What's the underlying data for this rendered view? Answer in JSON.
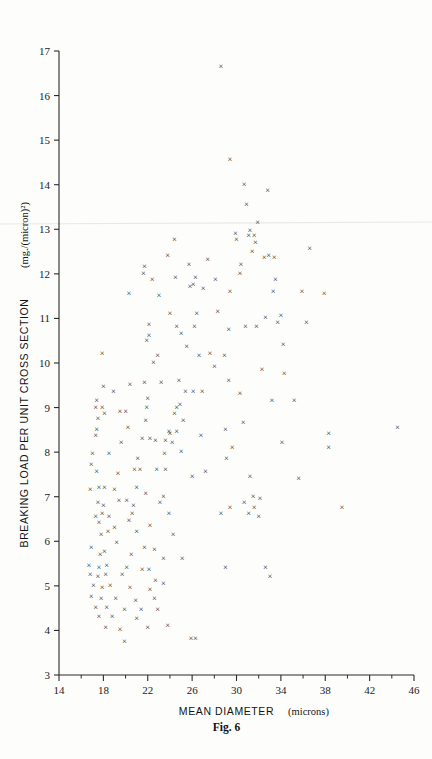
{
  "figure": {
    "caption": "Fig. 6",
    "marker_glyph": "×",
    "marker_color": "#252525",
    "background_color": "#fdfdfb",
    "axis_color": "#2a2a2a"
  },
  "chart_data": {
    "type": "scatter",
    "title": "",
    "xlabel_main": "MEAN DIAMETER",
    "xlabel_units": "(microns)",
    "xlabel": "MEAN DIAMETER (microns)",
    "ylabel_main": "BREAKING LOAD PER UNIT CROSS SECTION",
    "ylabel_units": "(mg./(micron)²)",
    "ylabel": "BREAKING LOAD PER UNIT CROSS SECTION (mg./(micron)²)",
    "xlim": [
      14,
      46
    ],
    "ylim": [
      3,
      17
    ],
    "xticks": [
      14,
      18,
      22,
      26,
      30,
      34,
      38,
      42,
      46
    ],
    "xticklabels": [
      "14",
      "18",
      "22",
      "26",
      "30",
      "34",
      "38",
      "42",
      "46"
    ],
    "xminorticks": [
      16,
      20,
      24,
      28,
      32,
      36,
      40,
      44
    ],
    "yticks": [
      3,
      4,
      5,
      6,
      7,
      8,
      9,
      10,
      11,
      12,
      13,
      14,
      15,
      16,
      17
    ],
    "yticklabels": [
      "3",
      "4",
      "5",
      "6",
      "7",
      "8",
      "9",
      "10",
      "11",
      "12",
      "13",
      "14",
      "15",
      "16",
      "17"
    ],
    "grid": false,
    "legend": false,
    "n_points": 205,
    "points": [
      [
        28.6,
        16.65
      ],
      [
        29.4,
        14.55
      ],
      [
        32.8,
        13.85
      ],
      [
        30.9,
        13.55
      ],
      [
        31.9,
        13.15
      ],
      [
        31.6,
        12.85
      ],
      [
        31.7,
        12.7
      ],
      [
        24.4,
        12.75
      ],
      [
        31.2,
        12.95
      ],
      [
        31.1,
        12.85
      ],
      [
        31.4,
        12.5
      ],
      [
        23.8,
        12.4
      ],
      [
        32.5,
        12.35
      ],
      [
        33.4,
        12.35
      ],
      [
        21.7,
        12.15
      ],
      [
        21.6,
        12.0
      ],
      [
        25.7,
        12.2
      ],
      [
        30.4,
        12.2
      ],
      [
        30.3,
        12.0
      ],
      [
        22.4,
        11.85
      ],
      [
        24.5,
        11.9
      ],
      [
        26.3,
        11.9
      ],
      [
        26.1,
        11.75
      ],
      [
        33.5,
        11.85
      ],
      [
        20.3,
        11.55
      ],
      [
        25.8,
        11.7
      ],
      [
        27.0,
        11.65
      ],
      [
        29.4,
        11.6
      ],
      [
        33.3,
        11.6
      ],
      [
        37.9,
        11.55
      ],
      [
        24.0,
        11.1
      ],
      [
        26.4,
        11.1
      ],
      [
        28.3,
        11.15
      ],
      [
        32.6,
        11.0
      ],
      [
        22.1,
        10.85
      ],
      [
        24.6,
        10.8
      ],
      [
        26.2,
        10.8
      ],
      [
        29.3,
        10.75
      ],
      [
        30.8,
        10.8
      ],
      [
        31.8,
        10.8
      ],
      [
        25.0,
        10.65
      ],
      [
        21.9,
        10.5
      ],
      [
        22.1,
        10.6
      ],
      [
        34.2,
        10.4
      ],
      [
        17.9,
        10.2
      ],
      [
        26.6,
        10.15
      ],
      [
        28.9,
        10.15
      ],
      [
        32.3,
        9.85
      ],
      [
        22.5,
        10.0
      ],
      [
        34.3,
        9.75
      ],
      [
        21.7,
        9.55
      ],
      [
        29.3,
        9.6
      ],
      [
        18.0,
        9.45
      ],
      [
        17.4,
        9.15
      ],
      [
        22.0,
        9.2
      ],
      [
        25.4,
        9.35
      ],
      [
        26.1,
        9.35
      ],
      [
        26.9,
        9.35
      ],
      [
        30.3,
        9.3
      ],
      [
        33.2,
        9.15
      ],
      [
        17.3,
        9.0
      ],
      [
        17.9,
        9.0
      ],
      [
        21.9,
        9.0
      ],
      [
        24.6,
        9.0
      ],
      [
        24.9,
        9.05
      ],
      [
        17.5,
        8.75
      ],
      [
        18.1,
        8.85
      ],
      [
        21.8,
        8.7
      ],
      [
        24.4,
        8.85
      ],
      [
        25.2,
        8.7
      ],
      [
        30.6,
        8.65
      ],
      [
        17.4,
        8.5
      ],
      [
        20.2,
        8.55
      ],
      [
        23.9,
        8.45
      ],
      [
        24.0,
        8.4
      ],
      [
        24.6,
        8.45
      ],
      [
        29.0,
        8.5
      ],
      [
        38.3,
        8.4
      ],
      [
        44.5,
        8.55
      ],
      [
        17.3,
        8.35
      ],
      [
        21.5,
        8.3
      ],
      [
        22.2,
        8.3
      ],
      [
        22.7,
        8.25
      ],
      [
        23.6,
        8.25
      ],
      [
        24.2,
        8.2
      ],
      [
        29.6,
        8.1
      ],
      [
        34.1,
        8.2
      ],
      [
        38.3,
        8.1
      ],
      [
        17.0,
        7.95
      ],
      [
        18.5,
        7.95
      ],
      [
        21.1,
        7.85
      ],
      [
        23.5,
        7.95
      ],
      [
        25.0,
        8.0
      ],
      [
        29.1,
        7.85
      ],
      [
        16.9,
        7.7
      ],
      [
        17.4,
        7.55
      ],
      [
        20.8,
        7.6
      ],
      [
        21.3,
        7.6
      ],
      [
        22.8,
        7.6
      ],
      [
        23.6,
        7.6
      ],
      [
        26.0,
        7.45
      ],
      [
        31.2,
        7.45
      ],
      [
        35.6,
        7.4
      ],
      [
        16.8,
        7.15
      ],
      [
        17.6,
        7.2
      ],
      [
        18.1,
        7.2
      ],
      [
        19.0,
        7.15
      ],
      [
        21.0,
        7.2
      ],
      [
        21.8,
        7.05
      ],
      [
        23.4,
        7.0
      ],
      [
        31.5,
        7.0
      ],
      [
        32.1,
        6.95
      ],
      [
        17.5,
        6.85
      ],
      [
        18.0,
        6.8
      ],
      [
        20.1,
        6.9
      ],
      [
        20.7,
        6.8
      ],
      [
        23.1,
        6.85
      ],
      [
        30.7,
        6.85
      ],
      [
        31.6,
        6.75
      ],
      [
        17.3,
        6.55
      ],
      [
        17.9,
        6.6
      ],
      [
        18.5,
        6.55
      ],
      [
        20.6,
        6.6
      ],
      [
        23.9,
        6.6
      ],
      [
        31.1,
        6.6
      ],
      [
        32.0,
        6.55
      ],
      [
        17.6,
        6.4
      ],
      [
        20.3,
        6.45
      ],
      [
        22.2,
        6.35
      ],
      [
        39.5,
        6.75
      ],
      [
        17.8,
        6.15
      ],
      [
        18.4,
        6.2
      ],
      [
        21.0,
        6.2
      ],
      [
        24.3,
        6.15
      ],
      [
        16.9,
        5.85
      ],
      [
        19.2,
        5.95
      ],
      [
        21.7,
        5.85
      ],
      [
        22.6,
        5.8
      ],
      [
        17.7,
        5.7
      ],
      [
        18.1,
        5.75
      ],
      [
        20.5,
        5.7
      ],
      [
        23.4,
        5.6
      ],
      [
        25.1,
        5.6
      ],
      [
        32.6,
        5.4
      ],
      [
        29.0,
        5.4
      ],
      [
        16.7,
        5.45
      ],
      [
        17.6,
        5.4
      ],
      [
        18.3,
        5.45
      ],
      [
        20.1,
        5.4
      ],
      [
        21.5,
        5.35
      ],
      [
        22.1,
        5.35
      ],
      [
        33.0,
        5.2
      ],
      [
        16.8,
        5.25
      ],
      [
        17.5,
        5.2
      ],
      [
        18.2,
        5.25
      ],
      [
        19.7,
        5.25
      ],
      [
        22.7,
        5.1
      ],
      [
        23.4,
        5.05
      ],
      [
        17.1,
        5.0
      ],
      [
        17.9,
        4.95
      ],
      [
        18.6,
        5.0
      ],
      [
        20.4,
        4.95
      ],
      [
        22.2,
        4.9
      ],
      [
        16.9,
        4.75
      ],
      [
        17.8,
        4.7
      ],
      [
        19.1,
        4.7
      ],
      [
        20.9,
        4.65
      ],
      [
        22.6,
        4.7
      ],
      [
        17.3,
        4.5
      ],
      [
        18.3,
        4.5
      ],
      [
        19.9,
        4.45
      ],
      [
        21.4,
        4.45
      ],
      [
        22.9,
        4.45
      ],
      [
        17.6,
        4.3
      ],
      [
        18.8,
        4.3
      ],
      [
        21.0,
        4.25
      ],
      [
        23.8,
        4.1
      ],
      [
        18.2,
        4.05
      ],
      [
        19.5,
        4.0
      ],
      [
        22.0,
        4.05
      ],
      [
        19.9,
        3.75
      ],
      [
        25.9,
        3.8
      ],
      [
        26.3,
        3.8
      ],
      [
        18.9,
        9.35
      ],
      [
        19.5,
        8.9
      ],
      [
        19.6,
        8.2
      ],
      [
        19.3,
        7.5
      ],
      [
        19.4,
        6.9
      ],
      [
        19.0,
        6.3
      ],
      [
        20.0,
        8.9
      ],
      [
        20.4,
        9.5
      ],
      [
        23.0,
        11.5
      ],
      [
        27.4,
        12.3
      ],
      [
        28.1,
        11.85
      ],
      [
        29.9,
        12.9
      ],
      [
        30.0,
        12.75
      ],
      [
        27.6,
        10.2
      ],
      [
        28.0,
        9.9
      ],
      [
        25.5,
        10.35
      ],
      [
        24.8,
        9.6
      ],
      [
        23.2,
        9.55
      ],
      [
        22.9,
        10.15
      ],
      [
        26.8,
        8.35
      ],
      [
        27.2,
        7.55
      ],
      [
        28.6,
        6.6
      ],
      [
        29.4,
        6.75
      ],
      [
        35.2,
        9.15
      ],
      [
        35.9,
        11.6
      ],
      [
        36.3,
        10.9
      ],
      [
        33.7,
        10.9
      ],
      [
        34.0,
        11.05
      ],
      [
        36.6,
        12.55
      ],
      [
        30.7,
        14.0
      ],
      [
        32.9,
        12.4
      ]
    ]
  }
}
